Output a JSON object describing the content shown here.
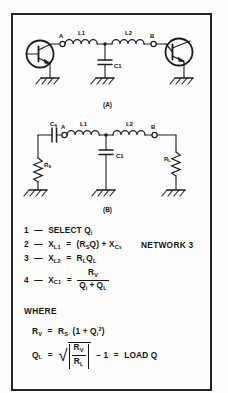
{
  "figure": {
    "title_label": "NETWORK 3",
    "panel_a_label": "(A)",
    "panel_b_label": "(B)",
    "where_label": "WHERE",
    "accent_color": "#242424",
    "background_color": "#fefefe"
  },
  "circuit_a": {
    "caption": "(A)",
    "node_a_label": "A",
    "node_b_label": "B",
    "components": [
      {
        "ref": "L1",
        "type": "inductor",
        "label": "L1"
      },
      {
        "ref": "L2",
        "type": "inductor",
        "label": "L2"
      },
      {
        "ref": "C1",
        "type": "capacitor",
        "label": "C1"
      },
      {
        "ref": "Q-left",
        "type": "transistor-npn",
        "label": ""
      },
      {
        "ref": "Q-right",
        "type": "transistor-npn",
        "label": ""
      }
    ],
    "ground_count": 3
  },
  "circuit_b": {
    "caption": "(B)",
    "node_a_label": "A",
    "node_b_label": "B",
    "components": [
      {
        "ref": "Cs",
        "type": "capacitor",
        "label": "C",
        "sub": "S"
      },
      {
        "ref": "Rs",
        "type": "resistor",
        "label": "R",
        "sub": "S"
      },
      {
        "ref": "L1",
        "type": "inductor",
        "label": "L1"
      },
      {
        "ref": "L2",
        "type": "inductor",
        "label": "L2"
      },
      {
        "ref": "C1",
        "type": "capacitor",
        "label": "C1"
      },
      {
        "ref": "RL",
        "type": "resistor",
        "label": "R",
        "sub": "L"
      }
    ],
    "ground_count": 3
  },
  "equations": [
    {
      "num": "1",
      "dash": "—",
      "lhs": "SELECT Q",
      "lhs_sub": "i",
      "rhs": ""
    },
    {
      "num": "2",
      "dash": "—",
      "lhs": "X",
      "lhs_sub": "L1",
      "eq": "=",
      "rhs": "(R",
      "rhs_sub1": "S",
      "rhs_mid": "Q) + X",
      "rhs_sub2": "C",
      "rhs_sub2b": "S"
    },
    {
      "num": "3",
      "dash": "—",
      "lhs": "X",
      "lhs_sub": "L2",
      "eq": "=",
      "rhs": "R",
      "rhs_sub1": "L",
      "rhs_mid": "Q",
      "rhs_sub2": "L"
    },
    {
      "num": "4",
      "dash": "—",
      "lhs": "X",
      "lhs_sub": "C1",
      "eq": "=",
      "numerator": "R",
      "numerator_sub": "V",
      "denominator_a": "Q",
      "denominator_a_sub": "i",
      "denominator_plus": "+",
      "denominator_b": "Q",
      "denominator_b_sub": "L"
    }
  ],
  "where": {
    "heading": "WHERE",
    "rv": {
      "lhs": "R",
      "lhs_sub": "V",
      "eq": "=",
      "rhs_r": "R",
      "rhs_r_sub": "S",
      "open": "(1 + Q",
      "q_sub": "i",
      "q_sup": "2",
      "close": ")"
    },
    "ql": {
      "lhs": "Q",
      "lhs_sub": "L",
      "eq": "=",
      "radical": "√",
      "num": "R",
      "num_sub": "V",
      "den": "R",
      "den_sub": "L",
      "minus_one": "−  1",
      "equals2": "=",
      "tail": "LOAD Q"
    }
  }
}
